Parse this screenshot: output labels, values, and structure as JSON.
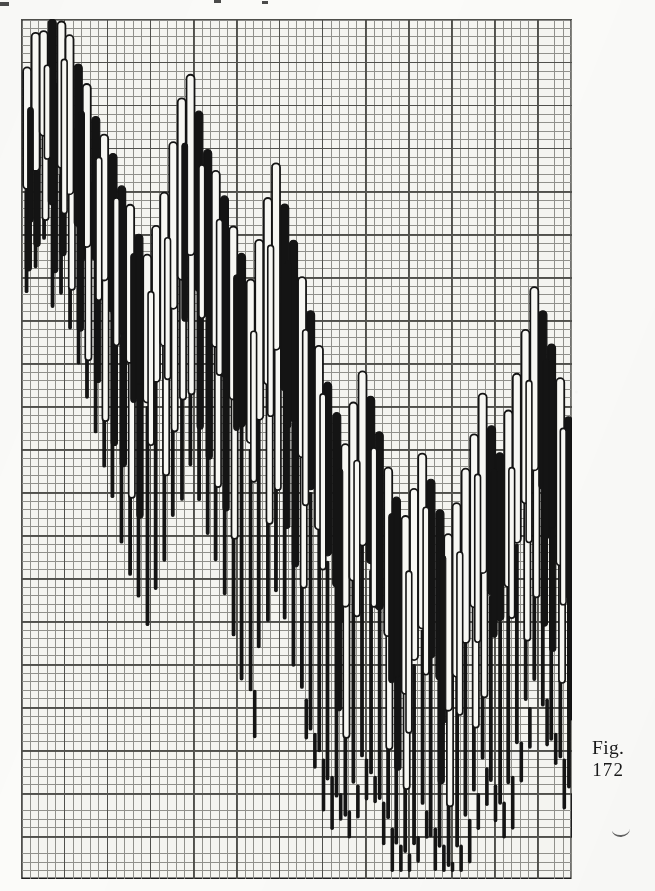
{
  "figure": {
    "caption_label": "Fig.",
    "caption_number": "172",
    "caption_left": 592,
    "caption_top": 736
  },
  "page": {
    "width": 655,
    "height": 891,
    "background_color": "#fbfbf9",
    "ink_color": "#151515"
  },
  "plot": {
    "left": 21,
    "top": 19,
    "width": 551,
    "height": 860,
    "background_color": "#f4f4f0",
    "border_color": "#1c1c1c",
    "grid": {
      "enabled": true,
      "minor_cell_px": 8.6,
      "minor_color": "#8b8b86",
      "major_every": 5,
      "major_color": "#4a4a46",
      "columns": 64,
      "rows": 100
    },
    "edge_ticks": [
      {
        "left": 0,
        "top": 2,
        "width": 9,
        "height": 4
      },
      {
        "left": 214,
        "top": 0,
        "width": 7,
        "height": 3
      },
      {
        "left": 262,
        "top": 1,
        "width": 6,
        "height": 3
      }
    ],
    "stray_mark": {
      "left": 612,
      "top": 828
    }
  },
  "chart_data": {
    "type": "candlestick",
    "title": "Fig. 172",
    "subtitle": "",
    "xlabel": "",
    "ylabel": "",
    "grid": true,
    "legend": null,
    "axis_labels_visible": false,
    "tick_labels_visible": false,
    "colors": {
      "up_body_fill": "#f7f7f3",
      "up_body_stroke": "#141414",
      "down_body_fill": "#141414",
      "down_body_stroke": "#141414",
      "wick": "#141414"
    },
    "y_axis": {
      "units": "grid rows from top of frame",
      "range_rows": [
        0,
        100
      ],
      "inverted": false
    },
    "x_axis": {
      "units": "period index (column)",
      "range": [
        0,
        63
      ]
    },
    "series_name": "price",
    "bar_width_px": 8.0,
    "column_pitch_px": 8.6,
    "candles": [
      {
        "i": 0,
        "top": 6,
        "body_top": 6,
        "body_bottom": 20,
        "wick_bottom": 33,
        "dir": "up"
      },
      {
        "i": 1,
        "top": 2,
        "body_top": 2,
        "body_bottom": 17,
        "wick_bottom": 30,
        "dir": "up"
      },
      {
        "i": 2,
        "top": 1,
        "body_top": 1,
        "body_bottom": 14,
        "wick_bottom": 26,
        "dir": "up"
      },
      {
        "i": 3,
        "top": 0,
        "body_top": 0,
        "body_bottom": 22,
        "wick_bottom": 34,
        "dir": "down"
      },
      {
        "i": 4,
        "top": 0,
        "body_top": 0,
        "body_bottom": 18,
        "wick_bottom": 31,
        "dir": "up"
      },
      {
        "i": 5,
        "top": 2,
        "body_top": 2,
        "body_bottom": 21,
        "wick_bottom": 36,
        "dir": "up"
      },
      {
        "i": 6,
        "top": 5,
        "body_top": 5,
        "body_bottom": 24,
        "wick_bottom": 40,
        "dir": "down"
      },
      {
        "i": 7,
        "top": 8,
        "body_top": 8,
        "body_bottom": 26,
        "wick_bottom": 44,
        "dir": "up"
      },
      {
        "i": 8,
        "top": 11,
        "body_top": 11,
        "body_bottom": 28,
        "wick_bottom": 48,
        "dir": "down"
      },
      {
        "i": 9,
        "top": 13,
        "body_top": 13,
        "body_bottom": 31,
        "wick_bottom": 52,
        "dir": "up"
      },
      {
        "i": 10,
        "top": 16,
        "body_top": 16,
        "body_bottom": 34,
        "wick_bottom": 56,
        "dir": "down"
      },
      {
        "i": 11,
        "top": 19,
        "body_top": 19,
        "body_bottom": 37,
        "wick_bottom": 60,
        "dir": "down"
      },
      {
        "i": 12,
        "top": 22,
        "body_top": 22,
        "body_bottom": 40,
        "wick_bottom": 64,
        "dir": "up"
      },
      {
        "i": 13,
        "top": 25,
        "body_top": 25,
        "body_bottom": 43,
        "wick_bottom": 68,
        "dir": "down"
      },
      {
        "i": 14,
        "top": 27,
        "body_top": 27,
        "body_bottom": 45,
        "wick_bottom": 70,
        "dir": "up"
      },
      {
        "i": 15,
        "top": 24,
        "body_top": 24,
        "body_bottom": 42,
        "wick_bottom": 66,
        "dir": "up"
      },
      {
        "i": 16,
        "top": 20,
        "body_top": 20,
        "body_bottom": 38,
        "wick_bottom": 62,
        "dir": "up"
      },
      {
        "i": 17,
        "top": 14,
        "body_top": 14,
        "body_bottom": 33,
        "wick_bottom": 58,
        "dir": "up"
      },
      {
        "i": 18,
        "top": 9,
        "body_top": 9,
        "body_bottom": 30,
        "wick_bottom": 55,
        "dir": "up"
      },
      {
        "i": 19,
        "top": 6,
        "body_top": 6,
        "body_bottom": 27,
        "wick_bottom": 52,
        "dir": "up"
      },
      {
        "i": 20,
        "top": 11,
        "body_top": 11,
        "body_bottom": 31,
        "wick_bottom": 56,
        "dir": "down"
      },
      {
        "i": 21,
        "top": 15,
        "body_top": 15,
        "body_bottom": 35,
        "wick_bottom": 60,
        "dir": "down"
      },
      {
        "i": 22,
        "top": 18,
        "body_top": 18,
        "body_bottom": 38,
        "wick_bottom": 64,
        "dir": "up"
      },
      {
        "i": 23,
        "top": 21,
        "body_top": 21,
        "body_bottom": 41,
        "wick_bottom": 68,
        "dir": "down"
      },
      {
        "i": 24,
        "top": 24,
        "body_top": 24,
        "body_bottom": 44,
        "wick_bottom": 72,
        "dir": "up"
      },
      {
        "i": 25,
        "top": 27,
        "body_top": 27,
        "body_bottom": 47,
        "wick_bottom": 76,
        "dir": "down"
      },
      {
        "i": 26,
        "top": 30,
        "body_top": 30,
        "body_bottom": 50,
        "wick_bottom": 78,
        "dir": "up"
      },
      {
        "i": 27,
        "top": 26,
        "body_top": 26,
        "body_bottom": 46,
        "wick_bottom": 74,
        "dir": "up"
      },
      {
        "i": 28,
        "top": 21,
        "body_top": 21,
        "body_bottom": 42,
        "wick_bottom": 70,
        "dir": "up"
      },
      {
        "i": 29,
        "top": 17,
        "body_top": 17,
        "body_bottom": 38,
        "wick_bottom": 66,
        "dir": "up"
      },
      {
        "i": 30,
        "top": 22,
        "body_top": 22,
        "body_bottom": 43,
        "wick_bottom": 71,
        "dir": "down"
      },
      {
        "i": 31,
        "top": 26,
        "body_top": 26,
        "body_bottom": 47,
        "wick_bottom": 75,
        "dir": "down"
      },
      {
        "i": 32,
        "top": 30,
        "body_top": 30,
        "body_bottom": 51,
        "wick_bottom": 79,
        "dir": "up"
      },
      {
        "i": 33,
        "top": 34,
        "body_top": 34,
        "body_bottom": 55,
        "wick_bottom": 83,
        "dir": "down"
      },
      {
        "i": 34,
        "top": 38,
        "body_top": 38,
        "body_bottom": 59,
        "wick_bottom": 86,
        "dir": "up"
      },
      {
        "i": 35,
        "top": 42,
        "body_top": 42,
        "body_bottom": 63,
        "wick_bottom": 88,
        "dir": "down"
      },
      {
        "i": 36,
        "top": 46,
        "body_top": 46,
        "body_bottom": 66,
        "wick_bottom": 90,
        "dir": "down"
      },
      {
        "i": 37,
        "top": 49,
        "body_top": 49,
        "body_bottom": 69,
        "wick_bottom": 92,
        "dir": "up"
      },
      {
        "i": 38,
        "top": 45,
        "body_top": 45,
        "body_bottom": 65,
        "wick_bottom": 89,
        "dir": "up"
      },
      {
        "i": 39,
        "top": 41,
        "body_top": 41,
        "body_bottom": 61,
        "wick_bottom": 86,
        "dir": "up"
      },
      {
        "i": 40,
        "top": 44,
        "body_top": 44,
        "body_bottom": 64,
        "wick_bottom": 88,
        "dir": "down"
      },
      {
        "i": 41,
        "top": 48,
        "body_top": 48,
        "body_bottom": 68,
        "wick_bottom": 91,
        "dir": "down"
      },
      {
        "i": 42,
        "top": 52,
        "body_top": 52,
        "body_bottom": 72,
        "wick_bottom": 94,
        "dir": "up"
      },
      {
        "i": 43,
        "top": 56,
        "body_top": 56,
        "body_bottom": 76,
        "wick_bottom": 96,
        "dir": "down"
      },
      {
        "i": 44,
        "top": 58,
        "body_top": 58,
        "body_bottom": 78,
        "wick_bottom": 97,
        "dir": "up"
      },
      {
        "i": 45,
        "top": 55,
        "body_top": 55,
        "body_bottom": 75,
        "wick_bottom": 95,
        "dir": "up"
      },
      {
        "i": 46,
        "top": 51,
        "body_top": 51,
        "body_bottom": 71,
        "wick_bottom": 92,
        "dir": "up"
      },
      {
        "i": 47,
        "top": 54,
        "body_top": 54,
        "body_bottom": 74,
        "wick_bottom": 94,
        "dir": "down"
      },
      {
        "i": 48,
        "top": 57,
        "body_top": 57,
        "body_bottom": 77,
        "wick_bottom": 96,
        "dir": "down"
      },
      {
        "i": 49,
        "top": 60,
        "body_top": 60,
        "body_bottom": 80,
        "wick_bottom": 98,
        "dir": "up"
      },
      {
        "i": 50,
        "top": 56,
        "body_top": 56,
        "body_bottom": 76,
        "wick_bottom": 96,
        "dir": "up"
      },
      {
        "i": 51,
        "top": 52,
        "body_top": 52,
        "body_bottom": 72,
        "wick_bottom": 93,
        "dir": "up"
      },
      {
        "i": 52,
        "top": 48,
        "body_top": 48,
        "body_bottom": 68,
        "wick_bottom": 90,
        "dir": "up"
      },
      {
        "i": 53,
        "top": 44,
        "body_top": 44,
        "body_bottom": 64,
        "wick_bottom": 87,
        "dir": "up"
      },
      {
        "i": 54,
        "top": 47,
        "body_top": 47,
        "body_bottom": 67,
        "wick_bottom": 89,
        "dir": "down"
      },
      {
        "i": 55,
        "top": 50,
        "body_top": 50,
        "body_bottom": 70,
        "wick_bottom": 91,
        "dir": "down"
      },
      {
        "i": 56,
        "top": 46,
        "body_top": 46,
        "body_bottom": 66,
        "wick_bottom": 88,
        "dir": "up"
      },
      {
        "i": 57,
        "top": 41,
        "body_top": 41,
        "body_bottom": 61,
        "wick_bottom": 84,
        "dir": "up"
      },
      {
        "i": 58,
        "top": 36,
        "body_top": 36,
        "body_bottom": 57,
        "wick_bottom": 80,
        "dir": "up"
      },
      {
        "i": 59,
        "top": 31,
        "body_top": 31,
        "body_bottom": 52,
        "wick_bottom": 76,
        "dir": "up"
      },
      {
        "i": 60,
        "top": 34,
        "body_top": 34,
        "body_bottom": 55,
        "wick_bottom": 79,
        "dir": "down"
      },
      {
        "i": 61,
        "top": 38,
        "body_top": 38,
        "body_bottom": 59,
        "wick_bottom": 83,
        "dir": "down"
      },
      {
        "i": 62,
        "top": 42,
        "body_top": 42,
        "body_bottom": 63,
        "wick_bottom": 86,
        "dir": "up"
      },
      {
        "i": 63,
        "top": 46,
        "body_top": 46,
        "body_bottom": 67,
        "wick_bottom": 90,
        "dir": "down"
      }
    ],
    "secondary_candles": [
      {
        "i": 0,
        "body_top": 14,
        "body_bottom": 30,
        "dir": "down"
      },
      {
        "i": 1,
        "body_top": 11,
        "body_bottom": 27,
        "dir": "down"
      },
      {
        "i": 2,
        "body_top": 9,
        "body_bottom": 24,
        "dir": "up"
      },
      {
        "i": 3,
        "body_top": 8,
        "body_bottom": 29,
        "dir": "down"
      },
      {
        "i": 4,
        "body_top": 10,
        "body_bottom": 28,
        "dir": "down"
      },
      {
        "i": 5,
        "body_top": 13,
        "body_bottom": 32,
        "dir": "up"
      },
      {
        "i": 6,
        "body_top": 17,
        "body_bottom": 36,
        "dir": "down"
      },
      {
        "i": 7,
        "body_top": 19,
        "body_bottom": 39,
        "dir": "up"
      },
      {
        "i": 8,
        "body_top": 22,
        "body_bottom": 42,
        "dir": "down"
      },
      {
        "i": 9,
        "body_top": 25,
        "body_bottom": 46,
        "dir": "up"
      },
      {
        "i": 10,
        "body_top": 28,
        "body_bottom": 49,
        "dir": "down"
      },
      {
        "i": 11,
        "body_top": 31,
        "body_bottom": 52,
        "dir": "down"
      },
      {
        "i": 12,
        "body_top": 34,
        "body_bottom": 55,
        "dir": "up"
      },
      {
        "i": 13,
        "body_top": 37,
        "body_bottom": 58,
        "dir": "down"
      },
      {
        "i": 16,
        "body_top": 33,
        "body_bottom": 53,
        "dir": "up"
      },
      {
        "i": 17,
        "body_top": 27,
        "body_bottom": 48,
        "dir": "up"
      },
      {
        "i": 18,
        "body_top": 24,
        "body_bottom": 45,
        "dir": "up"
      },
      {
        "i": 19,
        "body_top": 22,
        "body_bottom": 43,
        "dir": "up"
      },
      {
        "i": 20,
        "body_top": 26,
        "body_bottom": 47,
        "dir": "down"
      },
      {
        "i": 21,
        "body_top": 30,
        "body_bottom": 51,
        "dir": "down"
      },
      {
        "i": 22,
        "body_top": 33,
        "body_bottom": 54,
        "dir": "up"
      },
      {
        "i": 23,
        "body_top": 36,
        "body_bottom": 57,
        "dir": "down"
      },
      {
        "i": 24,
        "body_top": 39,
        "body_bottom": 60,
        "dir": "up"
      },
      {
        "i": 28,
        "body_top": 37,
        "body_bottom": 58,
        "dir": "up"
      },
      {
        "i": 29,
        "body_top": 33,
        "body_bottom": 54,
        "dir": "up"
      },
      {
        "i": 30,
        "body_top": 38,
        "body_bottom": 59,
        "dir": "down"
      },
      {
        "i": 31,
        "body_top": 42,
        "body_bottom": 63,
        "dir": "down"
      },
      {
        "i": 32,
        "body_top": 46,
        "body_bottom": 66,
        "dir": "up"
      },
      {
        "i": 36,
        "body_top": 61,
        "body_bottom": 80,
        "dir": "down"
      },
      {
        "i": 37,
        "body_top": 64,
        "body_bottom": 83,
        "dir": "up"
      },
      {
        "i": 42,
        "body_top": 67,
        "body_bottom": 85,
        "dir": "up"
      },
      {
        "i": 43,
        "body_top": 71,
        "body_bottom": 88,
        "dir": "down"
      },
      {
        "i": 44,
        "body_top": 73,
        "body_bottom": 90,
        "dir": "up"
      },
      {
        "i": 48,
        "body_top": 72,
        "body_bottom": 89,
        "dir": "down"
      },
      {
        "i": 49,
        "body_top": 75,
        "body_bottom": 91,
        "dir": "up"
      },
      {
        "i": 52,
        "body_top": 63,
        "body_bottom": 82,
        "dir": "up"
      },
      {
        "i": 53,
        "body_top": 59,
        "body_bottom": 79,
        "dir": "up"
      },
      {
        "i": 58,
        "body_top": 52,
        "body_bottom": 72,
        "dir": "up"
      },
      {
        "i": 59,
        "body_top": 47,
        "body_bottom": 68,
        "dir": "up"
      },
      {
        "i": 60,
        "body_top": 50,
        "body_bottom": 71,
        "dir": "down"
      },
      {
        "i": 61,
        "body_top": 54,
        "body_bottom": 74,
        "dir": "down"
      },
      {
        "i": 62,
        "body_top": 58,
        "body_bottom": 78,
        "dir": "up"
      },
      {
        "i": 63,
        "body_top": 62,
        "body_bottom": 82,
        "dir": "down"
      }
    ]
  }
}
